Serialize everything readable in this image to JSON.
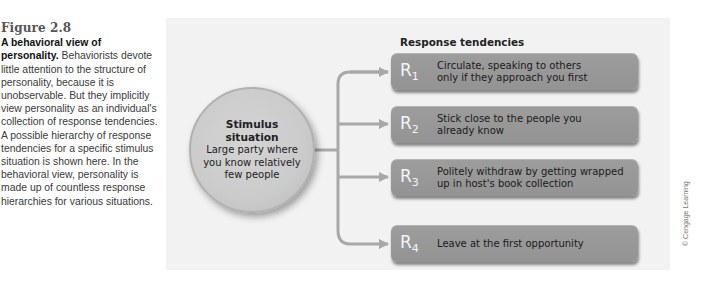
{
  "caption": {
    "figure_label": "Figure 2.8",
    "title": "A behavioral view of personality.",
    "body": "Behaviorists devote little attention to the structure of personality, because it is unobservable. But they implicitly view personality as an individual's collection of response tendencies. A possible hierarchy of response tendencies for a specific stimulus situation is shown here. In the behavioral view, personality is made up of countless response hierarchies for various situations."
  },
  "diagram": {
    "stimulus": {
      "title_line1": "Stimulus",
      "title_line2": "situation",
      "desc_line1": "Large party where",
      "desc_line2": "you know relatively",
      "desc_line3": "few people"
    },
    "response_heading": "Response tendencies",
    "responses": [
      {
        "label": "R",
        "index": "1",
        "line1": "Circulate, speaking to others",
        "line2": "only if they approach you first"
      },
      {
        "label": "R",
        "index": "2",
        "line1": "Stick close to the people you",
        "line2": "already know"
      },
      {
        "label": "R",
        "index": "3",
        "line1": "Politely withdraw by getting wrapped",
        "line2": "up in host's book collection"
      },
      {
        "label": "R",
        "index": "4",
        "line1": "Leave at the first opportunity",
        "line2": ""
      }
    ],
    "colors": {
      "panel_bg": "#f2f2f2",
      "circle_fill": "#cbcbcb",
      "box_fill": "#999999",
      "connector": "#a8a8a8"
    }
  },
  "credit": "© Cengage Learning"
}
